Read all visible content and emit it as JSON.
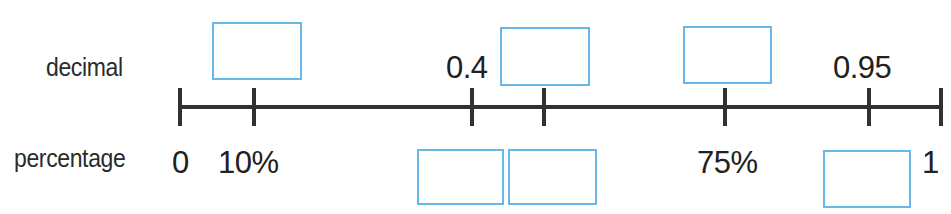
{
  "worksheet": {
    "title": "decimal and percentage number line",
    "row_labels": {
      "top": "decimal",
      "bottom": "percentage"
    },
    "accent_color": "#66b8e8",
    "line_color": "#333130",
    "text_color": "#222020"
  },
  "number_line": {
    "tick_count": 7,
    "ticks": [
      {
        "x": 180,
        "decimal": "",
        "percentage": "0"
      },
      {
        "x": 254,
        "decimal": "",
        "percentage": "10%"
      },
      {
        "x": 472,
        "decimal": "0.4",
        "percentage": ""
      },
      {
        "x": 544,
        "decimal": "",
        "percentage": ""
      },
      {
        "x": 725,
        "decimal": "",
        "percentage": "75%"
      },
      {
        "x": 869,
        "decimal": "0.95",
        "percentage": ""
      },
      {
        "x": 941,
        "decimal": "",
        "percentage": "1"
      }
    ]
  },
  "decimal_labels": [
    {
      "id": "decimal-0-4",
      "text": "0.4",
      "x": 446,
      "y": 50
    },
    {
      "id": "decimal-0-95",
      "text": "0.95",
      "x": 833,
      "y": 50
    }
  ],
  "percentage_labels": [
    {
      "id": "percentage-0",
      "text": "0",
      "x": 172,
      "y": 145
    },
    {
      "id": "percentage-10",
      "text": "10%",
      "x": 218,
      "y": 145
    },
    {
      "id": "percentage-75",
      "text": "75%",
      "x": 697,
      "y": 145
    },
    {
      "id": "percentage-1",
      "text": "1",
      "x": 922,
      "y": 145
    }
  ],
  "answer_boxes": {
    "decimal_row": [
      {
        "id": "decimal-answer-1",
        "x": 212,
        "y": 22,
        "w": 90,
        "h": 58
      },
      {
        "id": "decimal-answer-2",
        "x": 500,
        "y": 27,
        "w": 90,
        "h": 59
      },
      {
        "id": "decimal-answer-3",
        "x": 683,
        "y": 26,
        "w": 89,
        "h": 58
      }
    ],
    "percentage_row": [
      {
        "id": "percentage-answer-1",
        "x": 417,
        "y": 149,
        "w": 87,
        "h": 56
      },
      {
        "id": "percentage-answer-2",
        "x": 508,
        "y": 149,
        "w": 89,
        "h": 56
      },
      {
        "id": "percentage-answer-3",
        "x": 823,
        "y": 150,
        "w": 88,
        "h": 58
      }
    ]
  },
  "chart_data": {
    "type": "line",
    "xlabel": "",
    "ylabel": "",
    "xlim": [
      0,
      1
    ],
    "grid": false,
    "legend": "none",
    "categories": [
      "0",
      "0.1",
      "0.4",
      "0.5",
      "0.75",
      "0.95",
      "1"
    ],
    "series": [
      {
        "name": "decimal",
        "values": [
          "",
          "",
          "0.4",
          "",
          "",
          "0.95",
          ""
        ]
      },
      {
        "name": "percentage",
        "values": [
          "0",
          "10%",
          "",
          "",
          "75%",
          "",
          "1"
        ]
      }
    ],
    "annotations": [
      "Blank blue boxes mark values the student must fill in",
      "decimal row has 3 blank boxes",
      "percentage row has 3 blank boxes"
    ]
  }
}
